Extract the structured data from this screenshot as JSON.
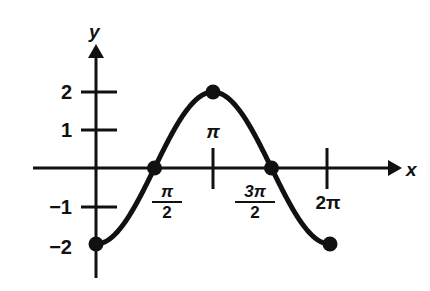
{
  "chart_data": {
    "type": "line",
    "title": "",
    "xlabel": "x",
    "ylabel": "y",
    "function": "y = -2cos(x)",
    "xlim": [
      0,
      6.283185
    ],
    "ylim": [
      -2,
      2
    ],
    "grid": false,
    "legend": false,
    "x_axis": {
      "label": "x",
      "tick_labels": [
        "π/2",
        "π",
        "3π/2",
        "2π"
      ],
      "tick_values": [
        1.570796,
        3.141593,
        4.712389,
        6.283185
      ],
      "ticks_drawn": [
        "π",
        "2π"
      ]
    },
    "y_axis": {
      "label": "y",
      "tick_labels": [
        "2",
        "1",
        "−1",
        "−2"
      ],
      "tick_values": [
        2,
        1,
        -1,
        -2
      ],
      "ticks_drawn": [
        2,
        1,
        -1
      ]
    },
    "points": [
      {
        "x": 0,
        "y": -2,
        "x_label": "0",
        "y_label": "−2",
        "marked": true
      },
      {
        "x": 1.570796,
        "y": 0,
        "x_label": "π/2",
        "y_label": "0",
        "marked": true
      },
      {
        "x": 3.141593,
        "y": 2,
        "x_label": "π",
        "y_label": "2",
        "marked": true
      },
      {
        "x": 4.712389,
        "y": 0,
        "x_label": "3π/2",
        "y_label": "0",
        "marked": true
      },
      {
        "x": 6.283185,
        "y": -2,
        "x_label": "2π",
        "y_label": "−2",
        "marked": true
      }
    ],
    "series": [
      {
        "name": "y = -2cos(x)",
        "color": "#111111",
        "x": [
          0,
          0.3927,
          0.7854,
          1.1781,
          1.5708,
          1.9635,
          2.3562,
          2.7489,
          3.1416,
          3.5343,
          3.927,
          4.3197,
          4.7124,
          5.1051,
          5.4978,
          5.8905,
          6.2832
        ],
        "values": [
          -2,
          -1.8478,
          -1.4142,
          -0.7654,
          0,
          0.7654,
          1.4142,
          1.8478,
          2,
          1.8478,
          1.4142,
          0.7654,
          0,
          -0.7654,
          -1.4142,
          -1.8478,
          -2
        ]
      }
    ]
  },
  "labels": {
    "y_axis_name": "y",
    "x_axis_name": "x",
    "y_two": "2",
    "y_one": "1",
    "y_neg_one": "−1",
    "y_neg_two": "−2",
    "pi_over_2_num": "π",
    "pi_over_2_den": "2",
    "pi": "π",
    "three_pi_over_2_num": "3π",
    "three_pi_over_2_den": "2",
    "two_pi": "2π"
  },
  "colors": {
    "curve": "#111111",
    "axis": "#111111",
    "background": "#ffffff"
  }
}
